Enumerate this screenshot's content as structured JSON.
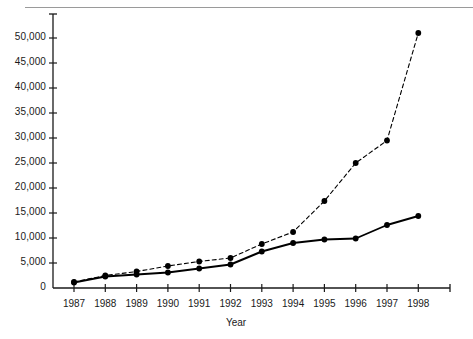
{
  "chart_data": {
    "type": "line",
    "title": "",
    "xlabel": "Year",
    "ylabel": "",
    "categories": [
      "1987",
      "1988",
      "1989",
      "1990",
      "1991",
      "1992",
      "1993",
      "1994",
      "1995",
      "1996",
      "1997",
      "1998"
    ],
    "ylim": [
      0,
      52000
    ],
    "xlim": [
      1986.5,
      1998.5
    ],
    "y_ticks": [
      0,
      5000,
      10000,
      15000,
      20000,
      25000,
      30000,
      35000,
      40000,
      45000,
      50000
    ],
    "y_tick_labels": [
      "0",
      "5,000",
      "10,000",
      "15,000",
      "20,000",
      "25,000",
      "30,000",
      "35,000",
      "40,000",
      "45,000",
      "50,000"
    ],
    "grid": false,
    "legend": "none",
    "series": [
      {
        "name": "series-dashed",
        "style": "dashed",
        "marker": "filled-circle",
        "color": "#000000",
        "values": [
          1200,
          2500,
          3300,
          4400,
          5300,
          6000,
          8800,
          11200,
          17400,
          25000,
          29500,
          51000
        ]
      },
      {
        "name": "series-solid",
        "style": "solid",
        "marker": "filled-circle",
        "color": "#000000",
        "values": [
          1100,
          2300,
          2700,
          3100,
          3900,
          4700,
          7300,
          9000,
          9700,
          9900,
          12600,
          14400
        ]
      }
    ]
  },
  "axes": {
    "x_axis_title": "Year"
  },
  "colors": {
    "axis": "#1a1a1a",
    "rule": "#9a9a9a",
    "background": "#ffffff"
  }
}
